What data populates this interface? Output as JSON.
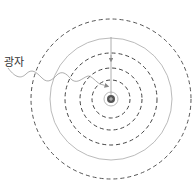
{
  "diagram": {
    "label_photon": "광자",
    "center": [
      111,
      99
    ],
    "orbits": [
      {
        "r": 80,
        "style": "dashed",
        "color": "#555555"
      },
      {
        "r": 61,
        "style": "solid",
        "color": "#bbbbbb"
      },
      {
        "r": 46,
        "style": "dashed",
        "color": "#444444"
      },
      {
        "r": 31,
        "style": "dashed",
        "color": "#444444"
      },
      {
        "r": 19,
        "style": "dashed",
        "color": "#444444"
      },
      {
        "r": 7,
        "style": "solid",
        "color": "#bbbbbb"
      }
    ],
    "nucleus": {
      "r": 4,
      "color": "#555555"
    }
  }
}
